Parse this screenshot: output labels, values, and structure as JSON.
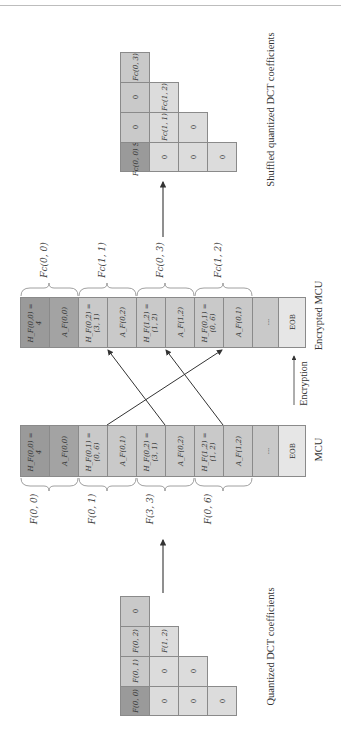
{
  "figure": {
    "orientation": "rotated -90deg (reads bottom-to-top)",
    "original_grid": {
      "caption": "Quantized DCT coefficients",
      "rows": [
        [
          "F(0, 0)",
          "F(0, 1)",
          "F(0, 2)",
          "0"
        ],
        [
          "0",
          "0",
          "F(1, 2)"
        ],
        [
          "0",
          "0"
        ],
        [
          "0"
        ]
      ]
    },
    "shuffled_grid": {
      "caption": "Shuffled quantized DCT coefficients",
      "rows": [
        [
          "Fc(0, 0) Size = 4",
          "0",
          "0",
          "Fc(0, 3)"
        ],
        [
          "0",
          "Fc(1, 1)",
          "Fc(1, 2)"
        ],
        [
          "0",
          "0"
        ],
        [
          "0"
        ]
      ]
    },
    "mcu": {
      "label": "MCU",
      "cells": [
        {
          "h": "H_F(0,0) =",
          "hv": "4",
          "a": "A_F(0,0)"
        },
        {
          "h": "H_F(0,1) =",
          "hv": "(0, 6)",
          "a": "A_F(0,1)"
        },
        {
          "h": "H_F(0,2) =",
          "hv": "(3, 1)",
          "a": "A_F(0,2)"
        },
        {
          "h": "H_F(1,2) =",
          "hv": "(1, 2)",
          "a": "A_F(1,2)"
        }
      ],
      "ellipsis": "...",
      "eob": "EOB",
      "brace_labels": [
        "F(0, 0)",
        "F(0, 1)",
        "F(3, 3)",
        "F(0, 6)"
      ]
    },
    "encrypted_mcu": {
      "label": "Encrypted MCU",
      "cells": [
        {
          "h": "H_F(0,0) =",
          "hv": "4",
          "a": "A_F(0,0)"
        },
        {
          "h": "H_F(0,2) =",
          "hv": "(3, 1)",
          "a": "A_F(0,2)"
        },
        {
          "h": "H_F(1,2) =",
          "hv": "(1, 2)",
          "a": "A_F(1,2)"
        },
        {
          "h": "H_F(0,1) =",
          "hv": "(0, 6)",
          "a": "A_F(0,1)"
        }
      ],
      "ellipsis": "...",
      "eob": "EOB",
      "brace_labels": [
        "Fc(0, 0)",
        "Fc(1, 1)",
        "Fc(0, 3)",
        "Fc(1, 2)"
      ]
    },
    "encryption_label": "Encryption",
    "colors": {
      "dc_dark": "#9a9a9a",
      "cell_mid": "#c9c9c9",
      "cell_light": "#dcdcdc",
      "eob": "#e6e6e6",
      "border": "#8a8a8a",
      "arrow": "#333333"
    }
  }
}
